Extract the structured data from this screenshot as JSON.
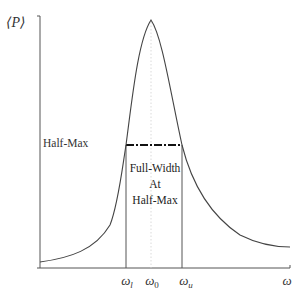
{
  "diagram": {
    "type": "resonance-curve",
    "y_axis_label": "⟨P⟩",
    "x_axis_label": "ω",
    "half_max_label": "Half-Max",
    "fwhm_annotation": [
      "Full-Width",
      "At",
      "Half-Max"
    ],
    "x_ticks": [
      {
        "symbol": "ω",
        "sub": "l",
        "name": "omega-lower"
      },
      {
        "symbol": "ω",
        "sub": "0",
        "name": "omega-center"
      },
      {
        "symbol": "ω",
        "sub": "u",
        "name": "omega-upper"
      }
    ],
    "colors": {
      "curve": "#444444",
      "axes": "#555555",
      "guide_lines": "#555555",
      "center_line": "#cccccc",
      "half_max_line": "#111111"
    }
  }
}
